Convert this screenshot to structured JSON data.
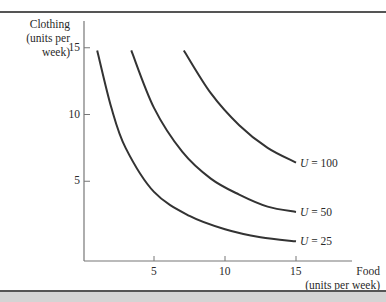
{
  "chart_data": {
    "type": "line",
    "title": "",
    "xlabel": "Food (units per week)",
    "ylabel": "Clothing (units per week)",
    "xlabel_lines": [
      "Food",
      "(units per week)"
    ],
    "ylabel_lines": [
      "Clothing",
      "(units per",
      "week)"
    ],
    "xlim": [
      0,
      16
    ],
    "ylim": [
      0,
      17
    ],
    "x_ticks": [
      5,
      10,
      15
    ],
    "y_ticks": [
      5,
      10,
      15
    ],
    "grid": false,
    "legend": "inline labels at curve ends",
    "series": [
      {
        "name": "U = 25",
        "label_var": "U",
        "label_val": "= 25",
        "points": [
          [
            1,
            14.8
          ],
          [
            2,
            10.5
          ],
          [
            3,
            7.5
          ],
          [
            5,
            4.2
          ],
          [
            7.5,
            2.4
          ],
          [
            10,
            1.4
          ],
          [
            12.5,
            0.8
          ],
          [
            15,
            0.5
          ]
        ]
      },
      {
        "name": "U = 50",
        "label_var": "U",
        "label_val": "= 50",
        "points": [
          [
            3.4,
            14.8
          ],
          [
            5,
            10.5
          ],
          [
            7,
            7.2
          ],
          [
            9,
            5.2
          ],
          [
            11,
            4.0
          ],
          [
            13,
            3.1
          ],
          [
            15,
            2.7
          ]
        ]
      },
      {
        "name": "U = 100",
        "label_var": "U",
        "label_val": "= 100",
        "points": [
          [
            7.1,
            14.8
          ],
          [
            9,
            11.6
          ],
          [
            11,
            9.2
          ],
          [
            13,
            7.5
          ],
          [
            15,
            6.4
          ]
        ]
      }
    ]
  },
  "axes": {
    "y_tick_labels": [
      "15",
      "10",
      "5"
    ],
    "x_tick_labels": [
      "5",
      "10",
      "15"
    ]
  }
}
